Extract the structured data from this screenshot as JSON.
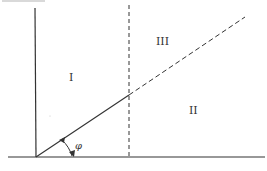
{
  "diagram": {
    "regions": [
      {
        "id": "region-1",
        "label": "I"
      },
      {
        "id": "region-2",
        "label": "II"
      },
      {
        "id": "region-3",
        "label": "III"
      }
    ],
    "angle_label": "φ",
    "line_color": "#333333"
  }
}
